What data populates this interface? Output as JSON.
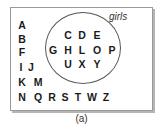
{
  "diagram": {
    "set_label": "girls",
    "caption": "(a)",
    "inside_set": [
      {
        "label": "C",
        "x": 68,
        "y": 35
      },
      {
        "label": "D",
        "x": 82,
        "y": 35
      },
      {
        "label": "E",
        "x": 97,
        "y": 35
      },
      {
        "label": "G",
        "x": 53,
        "y": 50
      },
      {
        "label": "H",
        "x": 68,
        "y": 50
      },
      {
        "label": "L",
        "x": 82,
        "y": 50
      },
      {
        "label": "O",
        "x": 97,
        "y": 50
      },
      {
        "label": "P",
        "x": 112,
        "y": 50
      },
      {
        "label": "U",
        "x": 68,
        "y": 64
      },
      {
        "label": "X",
        "x": 82,
        "y": 64
      },
      {
        "label": "Y",
        "x": 97,
        "y": 64
      }
    ],
    "outside_set": [
      {
        "label": "A",
        "x": 22,
        "y": 25
      },
      {
        "label": "B",
        "x": 22,
        "y": 39
      },
      {
        "label": "F",
        "x": 22,
        "y": 52
      },
      {
        "label": "I",
        "x": 21,
        "y": 67
      },
      {
        "label": "J",
        "x": 31,
        "y": 67
      },
      {
        "label": "K",
        "x": 22,
        "y": 82
      },
      {
        "label": "M",
        "x": 38,
        "y": 82
      },
      {
        "label": "N",
        "x": 22,
        "y": 97
      },
      {
        "label": "Q",
        "x": 38,
        "y": 97
      },
      {
        "label": "R",
        "x": 52,
        "y": 97
      },
      {
        "label": "S",
        "x": 65,
        "y": 97
      },
      {
        "label": "T",
        "x": 78,
        "y": 97
      },
      {
        "label": "W",
        "x": 92,
        "y": 97
      },
      {
        "label": "Z",
        "x": 106,
        "y": 97
      }
    ]
  }
}
